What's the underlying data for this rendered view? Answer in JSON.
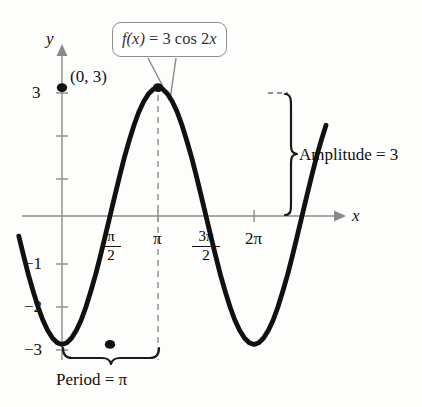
{
  "chart_data": {
    "type": "line",
    "title": "",
    "function_label": "f(x) = 3 cos 2x",
    "function_label_parts": {
      "name": "f",
      "arg": "(x)",
      "equals": "=",
      "expression": "3 cos 2x"
    },
    "amplitude": 3,
    "period_value": "π",
    "xlabel": "x",
    "ylabel": "y",
    "xlim": [
      -0.45,
      2.75
    ],
    "ylim": [
      -3.6,
      3.6
    ],
    "grid": false,
    "legend": "none",
    "x_ticks": [
      {
        "value": 0.5,
        "label": "π/2",
        "numerator": "π",
        "denominator": "2"
      },
      {
        "value": 1.0,
        "label": "π",
        "numerator": "",
        "denominator": ""
      },
      {
        "value": 1.5,
        "label": "3π/2",
        "numerator": "3π",
        "denominator": "2"
      },
      {
        "value": 2.0,
        "label": "2π",
        "numerator": "",
        "denominator": ""
      },
      {
        "value": 2.5,
        "label": "",
        "numerator": "",
        "denominator": ""
      }
    ],
    "y_ticks": [
      {
        "value": 3,
        "label": "3"
      },
      {
        "value": 2,
        "label": ""
      },
      {
        "value": 1,
        "label": ""
      },
      {
        "value": -1,
        "label": "−1"
      },
      {
        "value": -2,
        "label": "−2"
      },
      {
        "value": -3,
        "label": "−3"
      }
    ],
    "marked_points": [
      {
        "x": 0,
        "y": 3,
        "label": "(0, 3)"
      },
      {
        "x": 1.0,
        "y": 3,
        "label": ""
      },
      {
        "x": 0.5,
        "y": -3,
        "label": ""
      }
    ],
    "series": [
      {
        "name": "f(x) = 3 cos 2x",
        "color": "#111111",
        "x": [
          -0.45,
          -0.4,
          -0.35,
          -0.3,
          -0.25,
          -0.2,
          -0.15,
          -0.1,
          -0.05,
          0,
          0.05,
          0.1,
          0.15,
          0.2,
          0.25,
          0.3,
          0.35,
          0.4,
          0.45,
          0.5,
          0.55,
          0.6,
          0.65,
          0.7,
          0.75,
          0.8,
          0.85,
          0.9,
          0.95,
          1.0,
          1.05,
          1.1,
          1.15,
          1.2,
          1.25,
          1.3,
          1.35,
          1.4,
          1.45,
          1.5,
          1.55,
          1.6,
          1.65,
          1.7,
          1.75,
          1.8,
          1.85,
          1.9,
          1.95,
          2.0,
          2.05,
          2.1,
          2.15,
          2.2,
          2.25,
          2.3,
          2.35,
          2.4,
          2.45,
          2.5,
          2.55,
          2.6,
          2.65,
          2.7,
          2.75
        ],
        "y": [
          -0.47,
          -0.93,
          -1.37,
          -1.76,
          -2.12,
          -2.43,
          -2.67,
          -2.85,
          -2.96,
          -3.0,
          -2.96,
          -2.85,
          -2.67,
          -2.43,
          -2.12,
          -1.76,
          -1.37,
          -0.93,
          -0.47,
          0,
          0.47,
          0.93,
          1.37,
          1.76,
          2.12,
          2.43,
          2.67,
          2.85,
          2.96,
          3.0,
          2.96,
          2.85,
          2.67,
          2.43,
          2.12,
          1.76,
          1.37,
          0.93,
          0.47,
          0,
          -0.47,
          -0.93,
          -1.37,
          -1.76,
          -2.12,
          -2.43,
          -2.67,
          -2.85,
          -2.96,
          -3.0,
          -2.96,
          -2.85,
          -2.67,
          -2.43,
          -2.12,
          -1.76,
          -1.37,
          -0.93,
          -0.47,
          0,
          0.47,
          0.93,
          1.37,
          1.76,
          2.12
        ]
      }
    ],
    "annotations": [
      {
        "name": "amplitude",
        "text": "Amplitude = 3",
        "kind": "brace-vertical"
      },
      {
        "name": "period",
        "text": "Period = π",
        "kind": "brace-horizontal"
      },
      {
        "name": "point-label",
        "text": "(0, 3)",
        "kind": "point"
      }
    ]
  },
  "labels": {
    "y_axis": "y",
    "x_axis": "x",
    "point_0_3": "(0, 3)",
    "amplitude": "Amplitude = 3",
    "period": "Period = π",
    "y_tick_3": "3",
    "y_tick_neg1": "−1",
    "y_tick_neg2": "−2",
    "y_tick_neg3": "−3",
    "x_tick_pi": "π",
    "x_tick_2pi": "2π",
    "frac_pi_over_2_num": "π",
    "frac_pi_over_2_den": "2",
    "frac_3pi_over_2_num": "3π",
    "frac_3pi_over_2_den": "2"
  },
  "callout": {
    "fn_name": "f",
    "fn_arg": "(x)",
    "equals": " = 3 cos 2",
    "var": "x"
  },
  "colors": {
    "curve": "#111111",
    "axis": "#8a8a8a",
    "dashed": "#9a9a9a",
    "callout_border": "#8d8d8d",
    "text": "#111111",
    "callout_text": "#333333"
  }
}
